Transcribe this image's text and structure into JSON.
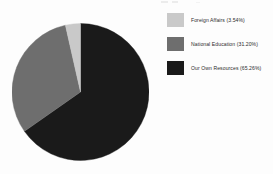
{
  "chart_data": {
    "type": "pie",
    "title": "",
    "xlabel": "",
    "ylabel": "",
    "grid": false,
    "legend_position": "right",
    "start_angle_deg": 0,
    "direction": "clockwise",
    "categories": [
      "Our Own Resources",
      "National Education",
      "Foreign Affairs"
    ],
    "values": [
      65.26,
      31.2,
      3.54
    ],
    "value_unit": "%",
    "slices": [
      {
        "label": "Our Own Resources",
        "value": 65.26,
        "value_text": "65.26%",
        "color": "#1a1a1a",
        "start_deg": 0,
        "end_deg": 234.94
      },
      {
        "label": "National Education",
        "value": 31.2,
        "value_text": "31.20%",
        "color": "#6e6e6e",
        "start_deg": 234.94,
        "end_deg": 347.26
      },
      {
        "label": "Foreign Affairs",
        "value": 3.54,
        "value_text": "3.54%",
        "color": "#c9c9c9",
        "start_deg": 347.26,
        "end_deg": 360
      }
    ]
  },
  "legend": {
    "items": [
      {
        "label": "Foreign Affairs (3.54%)",
        "color": "#c9c9c9"
      },
      {
        "label": "National Education (31.20%)",
        "color": "#6e6e6e"
      },
      {
        "label": "Our Own Resources (65.26%)",
        "color": "#1a1a1a"
      }
    ]
  },
  "colors": {
    "background": "#fdfdfd",
    "light_gray": "#c9c9c9",
    "medium_gray": "#6e6e6e",
    "dark": "#1a1a1a",
    "text": "#2c2c2c"
  }
}
